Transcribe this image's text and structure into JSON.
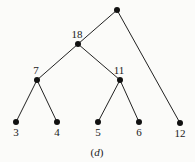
{
  "diagram": {
    "type": "binary-tree",
    "caption": {
      "open": "(",
      "letter": "d",
      "close": ")",
      "x": 97,
      "y": 156
    },
    "nodes": [
      {
        "id": "root",
        "label": "",
        "x": 117,
        "y": 10,
        "label_pos": "none"
      },
      {
        "id": "n18",
        "label": "18",
        "x": 78,
        "y": 44,
        "label_pos": "above"
      },
      {
        "id": "n12",
        "label": "12",
        "x": 180,
        "y": 123,
        "label_pos": "below"
      },
      {
        "id": "n7",
        "label": "7",
        "x": 37,
        "y": 80,
        "label_pos": "above"
      },
      {
        "id": "n11",
        "label": "11",
        "x": 120,
        "y": 80,
        "label_pos": "above"
      },
      {
        "id": "n3",
        "label": "3",
        "x": 16,
        "y": 122,
        "label_pos": "below"
      },
      {
        "id": "n4",
        "label": "4",
        "x": 57,
        "y": 122,
        "label_pos": "below"
      },
      {
        "id": "n5",
        "label": "5",
        "x": 98,
        "y": 122,
        "label_pos": "below"
      },
      {
        "id": "n6",
        "label": "6",
        "x": 139,
        "y": 122,
        "label_pos": "below"
      }
    ],
    "edges": [
      {
        "from": "root",
        "to": "n18"
      },
      {
        "from": "root",
        "to": "n12"
      },
      {
        "from": "n18",
        "to": "n7"
      },
      {
        "from": "n18",
        "to": "n11"
      },
      {
        "from": "n7",
        "to": "n3"
      },
      {
        "from": "n7",
        "to": "n4"
      },
      {
        "from": "n11",
        "to": "n5"
      },
      {
        "from": "n11",
        "to": "n6"
      }
    ],
    "colors": {
      "background": "#fbfbf9",
      "ink": "#111111"
    }
  }
}
